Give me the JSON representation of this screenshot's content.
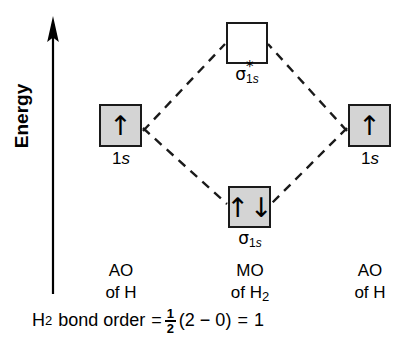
{
  "figure": {
    "type": "molecular-orbital-energy-diagram",
    "axis": {
      "label": "Energy",
      "direction": "up"
    },
    "orbitals": [
      {
        "id": "ao-left",
        "label_main": "1",
        "label_italic": "s",
        "electrons": 1,
        "spins": [
          "up"
        ],
        "fill": "#d4d4d4",
        "occupied": true
      },
      {
        "id": "mo-antibonding",
        "label_sigma": "σ",
        "label_star": "*",
        "label_sub_main": "1",
        "label_sub_italic": "s",
        "electrons": 0,
        "spins": [],
        "fill": "#ffffff",
        "occupied": false
      },
      {
        "id": "mo-bonding",
        "label_sigma": "σ",
        "label_sub_main": "1",
        "label_sub_italic": "s",
        "electrons": 2,
        "spins": [
          "up",
          "down"
        ],
        "fill": "#d4d4d4",
        "occupied": true
      },
      {
        "id": "ao-right",
        "label_main": "1",
        "label_italic": "s",
        "electrons": 1,
        "spins": [
          "up"
        ],
        "fill": "#d4d4d4",
        "occupied": true
      }
    ],
    "spin_glyphs": {
      "up": "↑",
      "down": "↓"
    },
    "columns": [
      {
        "id": "col-left",
        "line1": "AO",
        "line2_prefix": "of H",
        "line2_sub": ""
      },
      {
        "id": "col-middle",
        "line1": "MO",
        "line2_prefix": "of H",
        "line2_sub": "2"
      },
      {
        "id": "col-right",
        "line1": "AO",
        "line2_prefix": "of H",
        "line2_sub": ""
      }
    ],
    "bond_order": {
      "species_symbol": "H",
      "species_sub": "2",
      "phrase": "bond order",
      "equals1": "=",
      "fraction_numerator": "1",
      "fraction_denominator": "2",
      "open_paren": "(",
      "bonding_electrons": "2",
      "minus": "−",
      "antibonding_electrons": "0",
      "close_paren": ")",
      "equals2": "=",
      "result": "1"
    },
    "connector_style": "dashed"
  }
}
